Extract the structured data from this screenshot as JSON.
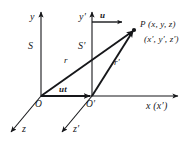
{
  "figure": {
    "type": "physics-vector-diagram",
    "background_color": "#ffffff",
    "stroke_color": "#16171a"
  },
  "frames": {
    "rest": {
      "name": "S",
      "origin_label": "O",
      "axes": {
        "y": "y",
        "x": "x",
        "z": "z"
      }
    },
    "moving": {
      "name": "S′",
      "origin_label": "O′",
      "axes": {
        "y": "y′",
        "x": "x′",
        "z": "z′"
      }
    }
  },
  "axis_labels": {
    "y": "y",
    "y_prime": "y′",
    "x_shared": "x (x′)",
    "z": "z",
    "z_prime": "z′"
  },
  "vectors": {
    "velocity": "u",
    "displacement": "ut",
    "position_rest": "r",
    "position_moving": "r′"
  },
  "point": {
    "name": "P",
    "coords_rest": "P (x, y, z)",
    "coords_moving": "(x′, y′, z′)"
  },
  "origins": {
    "rest": "O",
    "moving": "O′"
  }
}
